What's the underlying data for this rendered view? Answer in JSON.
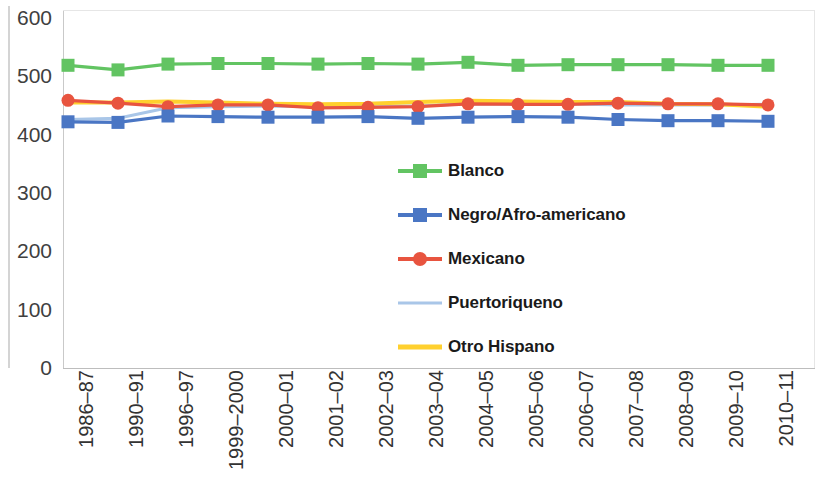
{
  "chart_data": {
    "type": "line",
    "title": "",
    "subtitle": "",
    "xlabel": "",
    "ylabel": "",
    "ylim": [
      0,
      600
    ],
    "y_ticks": [
      600,
      500,
      400,
      300,
      200,
      100,
      0
    ],
    "grid": false,
    "legend_position": "inside-center",
    "categories": [
      "1986–87",
      "1990–91",
      "1996–97",
      "1999–2000",
      "2000–01",
      "2001–02",
      "2002–03",
      "2003–04",
      "2004–05",
      "2005–06",
      "2006–07",
      "2007–08",
      "2008–09",
      "2009–10",
      "2010–11"
    ],
    "series": [
      {
        "name": "Blanco",
        "color": "#62C462",
        "marker": "square",
        "values": [
          519,
          511,
          521,
          522,
          522,
          521,
          522,
          521,
          524,
          519,
          520,
          520,
          520,
          519,
          519
        ]
      },
      {
        "name": "Negro/Afro-americano",
        "color": "#4A76C4",
        "marker": "square",
        "values": [
          422,
          421,
          432,
          431,
          430,
          430,
          431,
          428,
          430,
          431,
          430,
          426,
          424,
          424,
          423
        ]
      },
      {
        "name": "Mexicano",
        "color": "#E8543F",
        "marker": "circle",
        "values": [
          459,
          454,
          448,
          451,
          451,
          446,
          447,
          448,
          453,
          452,
          452,
          454,
          453,
          453,
          451
        ]
      },
      {
        "name": "Puertoriqueno",
        "color": "#A9C6E8",
        "marker": "none",
        "values": [
          426,
          428,
          446,
          448,
          449,
          448,
          449,
          449,
          453,
          452,
          453,
          451,
          451,
          451,
          452
        ]
      },
      {
        "name": "Otro Hispano",
        "color": "#FFD02E",
        "marker": "none",
        "values": [
          455,
          455,
          457,
          455,
          453,
          452,
          453,
          456,
          458,
          457,
          456,
          456,
          453,
          452,
          448
        ]
      }
    ]
  },
  "axes": {
    "y_tick_labels": [
      "600",
      "500",
      "400",
      "300",
      "200",
      "100",
      "0"
    ],
    "x_tick_labels": [
      "1986–87",
      "1990–91",
      "1996–97",
      "1999–2000",
      "2000–01",
      "2001–02",
      "2002–03",
      "2003–04",
      "2004–05",
      "2005–06",
      "2006–07",
      "2007–08",
      "2008–09",
      "2009–10",
      "2010–11"
    ]
  },
  "legend": {
    "entries": [
      {
        "label": "Blanco",
        "color": "#62C462",
        "marker": "square"
      },
      {
        "label": "Negro/Afro-americano",
        "color": "#4A76C4",
        "marker": "square"
      },
      {
        "label": "Mexicano",
        "color": "#E8543F",
        "marker": "circle"
      },
      {
        "label": "Puertoriqueno",
        "color": "#A9C6E8",
        "marker": "none"
      },
      {
        "label": "Otro Hispano",
        "color": "#FFD02E",
        "marker": "none"
      }
    ]
  }
}
